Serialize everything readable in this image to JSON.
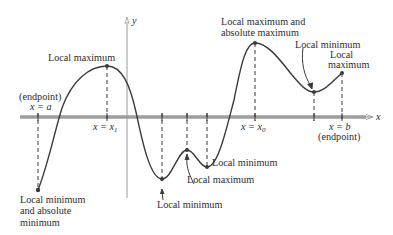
{
  "diagram": {
    "axes": {
      "x_label": "x",
      "y_label": "y",
      "x_axis_y": 117,
      "y_axis_x": 127,
      "x_axis_color": "#a8a8a8",
      "y_axis_color": "#9a9a9a",
      "x_ticks": [
        {
          "x": 38,
          "label": ""
        },
        {
          "x": 107,
          "label": "x = x₁"
        },
        {
          "x": 162,
          "label": ""
        },
        {
          "x": 187,
          "label": ""
        },
        {
          "x": 207,
          "label": ""
        },
        {
          "x": 255,
          "label": "x = x₀"
        },
        {
          "x": 314,
          "label": ""
        },
        {
          "x": 342,
          "label": "x = b"
        }
      ]
    },
    "curve_color": "#3a3a3a",
    "guide_color": "#3a3a3a",
    "points": [
      {
        "name": "left-endpoint",
        "x": 38,
        "y": 190
      },
      {
        "name": "local-max-x1",
        "x": 107,
        "y": 66
      },
      {
        "name": "local-min-1",
        "x": 162,
        "y": 179
      },
      {
        "name": "local-max-2",
        "x": 187,
        "y": 150
      },
      {
        "name": "local-min-2",
        "x": 207,
        "y": 167
      },
      {
        "name": "abs-max-x0",
        "x": 255,
        "y": 43
      },
      {
        "name": "local-min-3",
        "x": 314,
        "y": 92
      },
      {
        "name": "right-endpoint",
        "x": 342,
        "y": 73
      }
    ],
    "labels": {
      "endpoint_a_line1": "(endpoint)",
      "endpoint_a_line2": "x = a",
      "local_max_x1": "Local maximum",
      "abs_max_line1": "Local maximum and",
      "abs_max_line2": "absolute maximum",
      "local_min_right": "Local minimum",
      "local_max_right_line1": "Local",
      "local_max_right_line2": "maximum",
      "x1_label": "x = x",
      "x1_sub": "1",
      "x0_label": "x = x",
      "x0_sub": "0",
      "xb_label": "x = b",
      "endpoint_b": "(endpoint)",
      "local_min_bottom_mid": "Local minimum",
      "local_max_bottom_mid": "Local maximum",
      "local_min_bottom_right": "Local minimum",
      "abs_min_line1": "Local minimum",
      "abs_min_line2": "and absolute",
      "abs_min_line3": "minimum"
    }
  }
}
